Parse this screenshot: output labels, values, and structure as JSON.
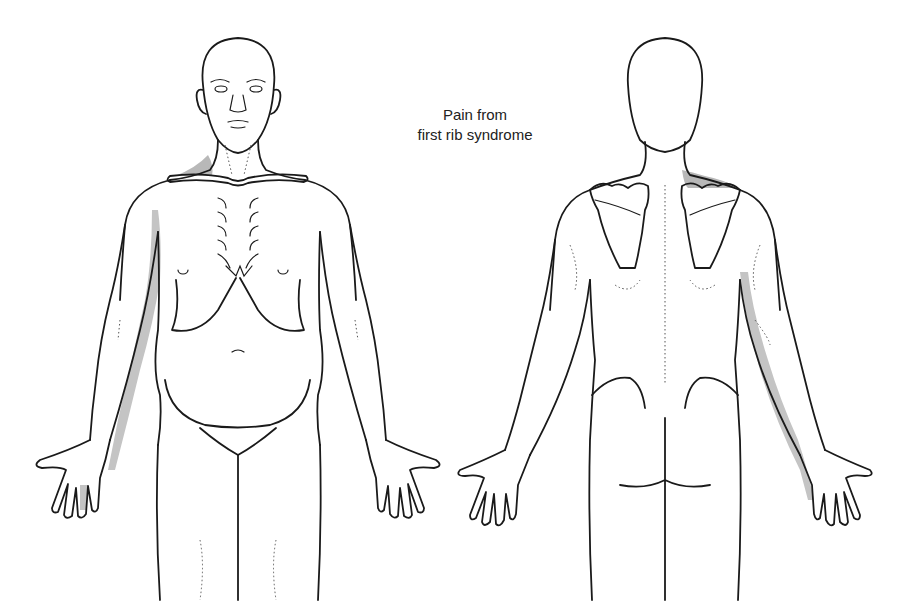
{
  "title": {
    "line1": "Pain from",
    "line2": "first rib syndrome"
  },
  "figures": [
    {
      "view": "anterior",
      "label": "front-view-figure"
    },
    {
      "view": "posterior",
      "label": "back-view-figure"
    }
  ],
  "colors": {
    "outline": "#1a1a1a",
    "pain_shading": "#b8b8b8",
    "background": "#ffffff"
  },
  "pain_regions": [
    {
      "view": "anterior",
      "region": "right supraclavicular / upper trapezius area"
    },
    {
      "view": "anterior",
      "region": "medial upper arm and ulnar forearm"
    },
    {
      "view": "anterior",
      "region": "ulnar fingers (ring and little)"
    },
    {
      "view": "posterior",
      "region": "upper trapezius over left scapula"
    },
    {
      "view": "posterior",
      "region": "posteromedial arm and ulnar forearm"
    },
    {
      "view": "posterior",
      "region": "ulnar fingers (ring and little)"
    }
  ]
}
